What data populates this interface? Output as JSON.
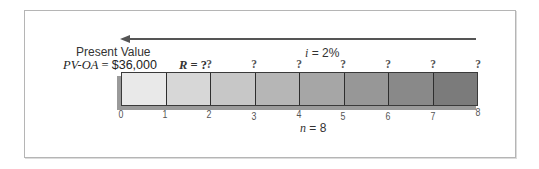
{
  "diagram": {
    "type": "annuity-timeline",
    "present_value": {
      "label": "Present Value",
      "formula_var": "PV-OA",
      "equals": " = ",
      "amount": "$36,000"
    },
    "payment": {
      "var": "R",
      "equals": " = ",
      "value": "?"
    },
    "interest_rate": {
      "var": "i",
      "text": " = 2%"
    },
    "periods": {
      "var": "n",
      "text": " = 8"
    },
    "arrow": {
      "direction": "left",
      "meaning": "discount to present value",
      "color": "#555555"
    },
    "payment_marks": [
      "?",
      "?",
      "?",
      "?",
      "?",
      "?",
      "?"
    ],
    "ticks": [
      "0",
      "1",
      "2",
      "3",
      "4",
      "5",
      "6",
      "7",
      "8"
    ],
    "cells": [
      {
        "period": 1,
        "color": "#e9e9e9"
      },
      {
        "period": 2,
        "color": "#d7d7d7"
      },
      {
        "period": 3,
        "color": "#c7c7c7"
      },
      {
        "period": 4,
        "color": "#b6b6b6"
      },
      {
        "period": 5,
        "color": "#a6a6a6"
      },
      {
        "period": 6,
        "color": "#979797"
      },
      {
        "period": 7,
        "color": "#898989"
      },
      {
        "period": 8,
        "color": "#7b7b7b"
      }
    ]
  }
}
